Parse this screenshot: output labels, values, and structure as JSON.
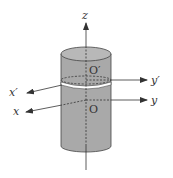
{
  "diagram": {
    "labels": {
      "z": "z",
      "y_prime": "y′",
      "y": "y",
      "x_prime": "x′",
      "x": "x",
      "O_prime": "O′",
      "O": "O"
    },
    "colors": {
      "cylinder_fill": "#a9a9a9",
      "top_fill": "#b8b8b8",
      "stroke": "#333333",
      "slit": "#ffffff"
    }
  }
}
